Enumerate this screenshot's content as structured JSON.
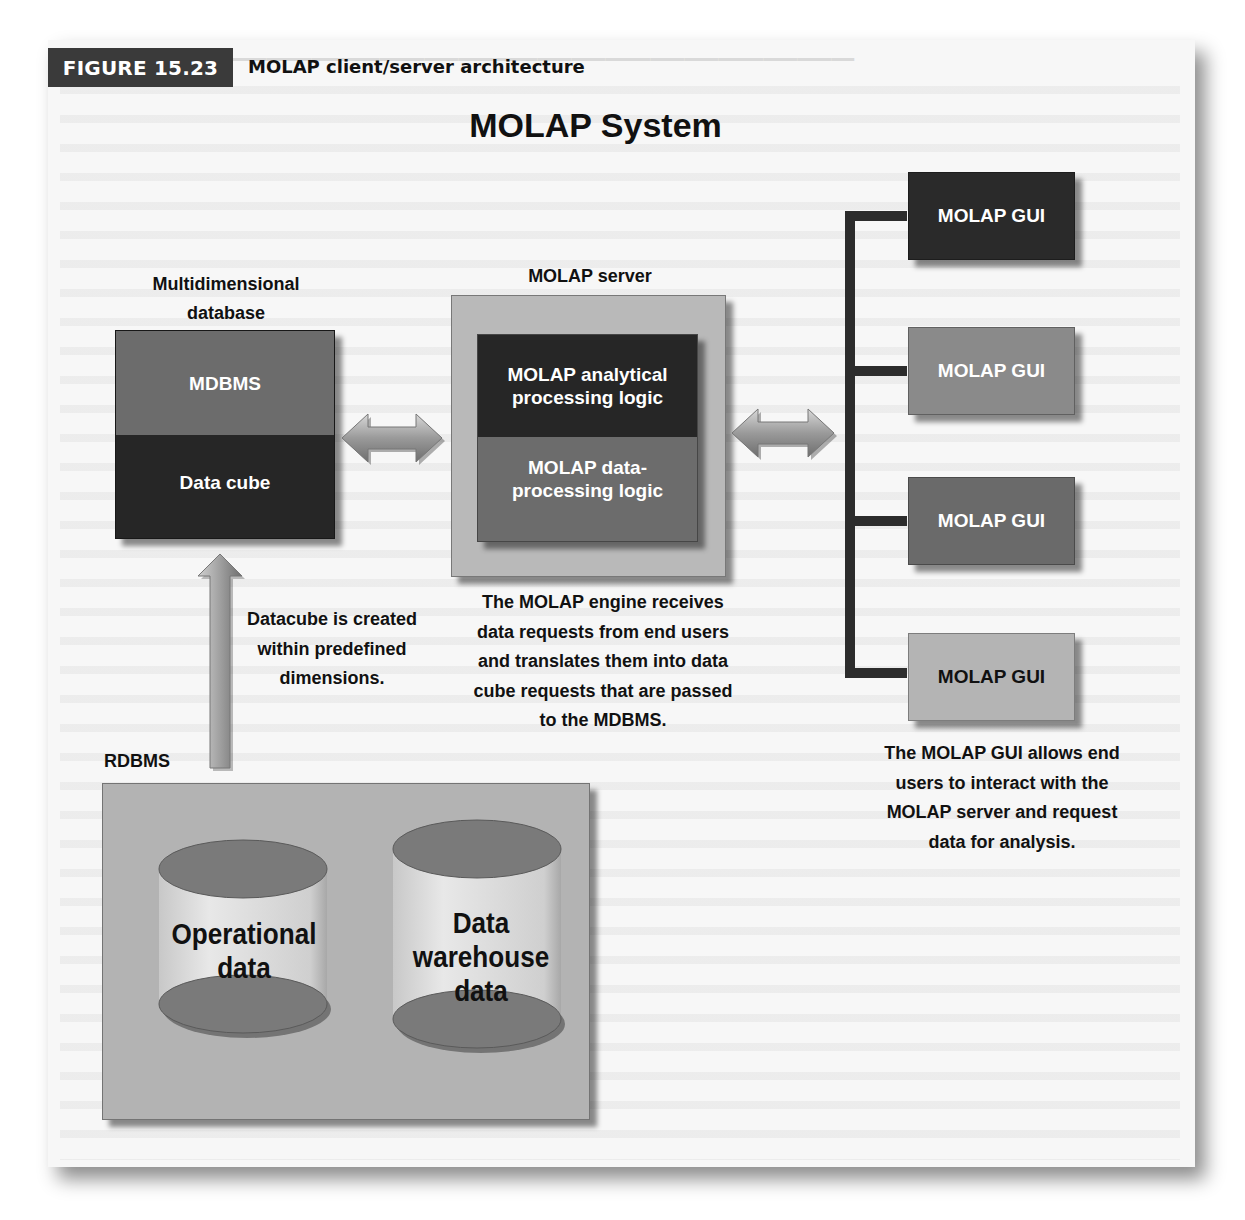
{
  "figure": {
    "number_label": "FIGURE 15.23",
    "caption": "MOLAP client/server architecture"
  },
  "diagram": {
    "title": "MOLAP System",
    "multidimensional_database": {
      "heading_line1": "Multidimensional",
      "heading_line2": "database",
      "top_layer": "MDBMS",
      "bottom_layer": "Data cube"
    },
    "molap_server": {
      "heading": "MOLAP server",
      "top_layer_line1": "MOLAP analytical",
      "top_layer_line2": "processing logic",
      "bottom_layer_line1": "MOLAP data-",
      "bottom_layer_line2": "processing logic",
      "description": [
        "The MOLAP engine receives",
        "data requests from end users",
        "and translates them into data",
        "cube requests that are passed",
        "to the MDBMS."
      ]
    },
    "datacube_note": [
      "Datacube is created",
      "within predefined",
      "dimensions."
    ],
    "rdbms": {
      "heading": "RDBMS",
      "stores": [
        {
          "line1": "Operational",
          "line2": "data",
          "line3": ""
        },
        {
          "line1": "Data",
          "line2": "warehouse",
          "line3": "data"
        }
      ]
    },
    "gui_clients": [
      {
        "label": "MOLAP GUI",
        "fill": "#2a2a2a",
        "text_color": "#ffffff"
      },
      {
        "label": "MOLAP GUI",
        "fill": "#8a8a8a",
        "text_color": "#ffffff"
      },
      {
        "label": "MOLAP GUI",
        "fill": "#6a6a6a",
        "text_color": "#ffffff"
      },
      {
        "label": "MOLAP GUI",
        "fill": "#b4b4b4",
        "text_color": "#111111"
      }
    ],
    "gui_description": [
      "The MOLAP GUI allows end",
      "users to interact with the",
      "MOLAP server and request",
      "data for analysis."
    ]
  },
  "colors": {
    "dark_layer": "#262626",
    "mid_layer": "#6c6c6c",
    "server_frame": "#b9b9b9",
    "rdbms_panel": "#b3b3b3",
    "cylinder_body": "#dcdcdc",
    "cylinder_cap": "#7a7a7a",
    "badge": "#3a3a3a"
  }
}
